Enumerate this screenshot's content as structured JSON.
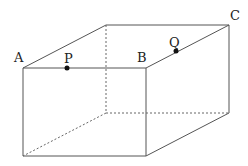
{
  "diagram": {
    "type": "rectangular-prism",
    "vertices": {
      "A": [
        23,
        68
      ],
      "B": [
        146,
        68
      ],
      "C": [
        229,
        25
      ],
      "D_top_back_left": [
        106,
        25
      ],
      "E_bottom_front_left": [
        23,
        156
      ],
      "F_bottom_front_right": [
        146,
        156
      ],
      "G_bottom_back_right": [
        229,
        113
      ],
      "H_bottom_back_left": [
        106,
        113
      ]
    },
    "points": {
      "P": {
        "label": "P",
        "on_edge": "AB",
        "position": [
          67,
          68
        ]
      },
      "Q": {
        "label": "Q",
        "on_edge": "BC",
        "position": [
          176,
          51
        ]
      }
    },
    "labels": {
      "A": "A",
      "B": "B",
      "C": "C",
      "P": "P",
      "Q": "Q"
    },
    "colors": {
      "edge": "#555555",
      "hidden_edge": "#666666",
      "point": "#111111",
      "text": "#222222",
      "background": "#ffffff"
    }
  }
}
